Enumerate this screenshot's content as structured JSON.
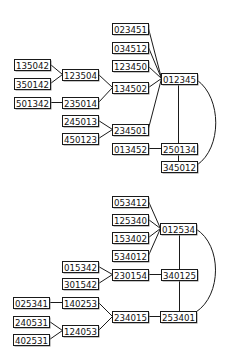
{
  "diagrams": [
    {
      "name": "graph-top",
      "nodes": [
        {
          "id": "023451",
          "label": "023451",
          "x": 112,
          "y": 23,
          "w": 36,
          "h": 11
        },
        {
          "id": "034512",
          "label": "034512",
          "x": 112,
          "y": 42,
          "w": 36,
          "h": 11
        },
        {
          "id": "123450",
          "label": "123450",
          "x": 112,
          "y": 60,
          "w": 36,
          "h": 11
        },
        {
          "id": "012345",
          "label": "012345",
          "x": 161,
          "y": 73,
          "w": 36,
          "h": 11
        },
        {
          "id": "135042",
          "label": "135042",
          "x": 14,
          "y": 59,
          "w": 36,
          "h": 11
        },
        {
          "id": "350142",
          "label": "350142",
          "x": 14,
          "y": 78,
          "w": 36,
          "h": 11
        },
        {
          "id": "123504",
          "label": "123504",
          "x": 62,
          "y": 69,
          "w": 36,
          "h": 11
        },
        {
          "id": "134502",
          "label": "134502",
          "x": 112,
          "y": 82,
          "w": 36,
          "h": 11
        },
        {
          "id": "501342",
          "label": "501342",
          "x": 14,
          "y": 97,
          "w": 36,
          "h": 11
        },
        {
          "id": "235014",
          "label": "235014",
          "x": 62,
          "y": 97,
          "w": 36,
          "h": 11
        },
        {
          "id": "245013",
          "label": "245013",
          "x": 62,
          "y": 115,
          "w": 36,
          "h": 11
        },
        {
          "id": "450123",
          "label": "450123",
          "x": 62,
          "y": 133,
          "w": 36,
          "h": 11
        },
        {
          "id": "234501",
          "label": "234501",
          "x": 112,
          "y": 124,
          "w": 36,
          "h": 11
        },
        {
          "id": "013452",
          "label": "013452",
          "x": 112,
          "y": 143,
          "w": 36,
          "h": 11
        },
        {
          "id": "250134",
          "label": "250134",
          "x": 161,
          "y": 143,
          "w": 36,
          "h": 11
        },
        {
          "id": "345012",
          "label": "345012",
          "x": 161,
          "y": 161,
          "w": 36,
          "h": 11
        }
      ],
      "edges": [
        {
          "from": "023451",
          "to": "012345",
          "type": "line",
          "pts": [
            148,
            28,
            161,
            78
          ]
        },
        {
          "from": "034512",
          "to": "012345",
          "type": "line",
          "pts": [
            148,
            47,
            161,
            78
          ]
        },
        {
          "from": "123450",
          "to": "012345",
          "type": "line",
          "pts": [
            148,
            66,
            161,
            78
          ]
        },
        {
          "from": "134502",
          "to": "012345",
          "type": "line",
          "pts": [
            148,
            87,
            161,
            78
          ]
        },
        {
          "from": "234501",
          "to": "012345",
          "type": "line",
          "pts": [
            148,
            128,
            161,
            78
          ]
        },
        {
          "from": "135042",
          "to": "123504",
          "type": "line",
          "pts": [
            50,
            64,
            62,
            74
          ]
        },
        {
          "from": "350142",
          "to": "123504",
          "type": "line",
          "pts": [
            50,
            83,
            62,
            74
          ]
        },
        {
          "from": "123504",
          "to": "134502",
          "type": "line",
          "pts": [
            98,
            74,
            112,
            87
          ]
        },
        {
          "from": "501342",
          "to": "235014",
          "type": "line",
          "pts": [
            50,
            102,
            62,
            102
          ]
        },
        {
          "from": "235014",
          "to": "134502",
          "type": "line",
          "pts": [
            98,
            102,
            112,
            87
          ]
        },
        {
          "from": "245013",
          "to": "234501",
          "type": "line",
          "pts": [
            98,
            120,
            112,
            129
          ]
        },
        {
          "from": "450123",
          "to": "234501",
          "type": "line",
          "pts": [
            98,
            138,
            112,
            129
          ]
        },
        {
          "from": "013452",
          "to": "250134",
          "type": "line",
          "pts": [
            148,
            148,
            161,
            148
          ]
        },
        {
          "from": "012345",
          "to": "250134",
          "type": "line",
          "pts": [
            178,
            84,
            178,
            143
          ]
        },
        {
          "from": "250134",
          "to": "345012",
          "type": "line",
          "pts": [
            178,
            154,
            178,
            161
          ]
        },
        {
          "from": "012345",
          "to": "345012",
          "type": "curve",
          "d": "M 197 80 C 222 98, 222 148, 197 165"
        }
      ]
    },
    {
      "name": "graph-bottom",
      "nodes": [
        {
          "id": "053412",
          "label": "053412",
          "x": 112,
          "y": 196,
          "w": 36,
          "h": 11
        },
        {
          "id": "125340",
          "label": "125340",
          "x": 112,
          "y": 214,
          "w": 36,
          "h": 11
        },
        {
          "id": "153402",
          "label": "153402",
          "x": 112,
          "y": 232,
          "w": 36,
          "h": 11
        },
        {
          "id": "534012",
          "label": "534012",
          "x": 112,
          "y": 250,
          "w": 36,
          "h": 11
        },
        {
          "id": "012534",
          "label": "012534",
          "x": 160,
          "y": 223,
          "w": 36,
          "h": 11
        },
        {
          "id": "015342",
          "label": "015342",
          "x": 62,
          "y": 261,
          "w": 36,
          "h": 11
        },
        {
          "id": "301542",
          "label": "301542",
          "x": 62,
          "y": 278,
          "w": 36,
          "h": 11
        },
        {
          "id": "230154",
          "label": "230154",
          "x": 112,
          "y": 269,
          "w": 36,
          "h": 11
        },
        {
          "id": "340125",
          "label": "340125",
          "x": 161,
          "y": 269,
          "w": 36,
          "h": 11
        },
        {
          "id": "025341",
          "label": "025341",
          "x": 13,
          "y": 297,
          "w": 36,
          "h": 11
        },
        {
          "id": "140253",
          "label": "140253",
          "x": 62,
          "y": 297,
          "w": 36,
          "h": 11
        },
        {
          "id": "240531",
          "label": "240531",
          "x": 13,
          "y": 316,
          "w": 36,
          "h": 11
        },
        {
          "id": "124053",
          "label": "124053",
          "x": 62,
          "y": 325,
          "w": 36,
          "h": 11
        },
        {
          "id": "402531",
          "label": "402531",
          "x": 13,
          "y": 334,
          "w": 36,
          "h": 11
        },
        {
          "id": "234015",
          "label": "234015",
          "x": 112,
          "y": 311,
          "w": 36,
          "h": 11
        },
        {
          "id": "253401",
          "label": "253401",
          "x": 160,
          "y": 311,
          "w": 36,
          "h": 11
        }
      ],
      "edges": [
        {
          "from": "053412",
          "to": "012534",
          "type": "line",
          "pts": [
            148,
            201,
            160,
            228
          ]
        },
        {
          "from": "125340",
          "to": "012534",
          "type": "line",
          "pts": [
            148,
            219,
            160,
            228
          ]
        },
        {
          "from": "153402",
          "to": "012534",
          "type": "line",
          "pts": [
            148,
            237,
            160,
            228
          ]
        },
        {
          "from": "534012",
          "to": "012534",
          "type": "line",
          "pts": [
            148,
            255,
            160,
            228
          ]
        },
        {
          "from": "015342",
          "to": "230154",
          "type": "line",
          "pts": [
            98,
            266,
            112,
            274
          ]
        },
        {
          "from": "301542",
          "to": "230154",
          "type": "line",
          "pts": [
            98,
            283,
            112,
            274
          ]
        },
        {
          "from": "230154",
          "to": "340125",
          "type": "line",
          "pts": [
            148,
            274,
            161,
            274
          ]
        },
        {
          "from": "012534",
          "to": "340125",
          "type": "line",
          "pts": [
            179,
            234,
            179,
            269
          ]
        },
        {
          "from": "340125",
          "to": "253401",
          "type": "line",
          "pts": [
            179,
            280,
            179,
            311
          ]
        },
        {
          "from": "025341",
          "to": "140253",
          "type": "line",
          "pts": [
            49,
            302,
            62,
            302
          ]
        },
        {
          "from": "140253",
          "to": "234015",
          "type": "line",
          "pts": [
            98,
            302,
            112,
            316
          ]
        },
        {
          "from": "240531",
          "to": "124053",
          "type": "line",
          "pts": [
            49,
            321,
            62,
            330
          ]
        },
        {
          "from": "402531",
          "to": "124053",
          "type": "line",
          "pts": [
            49,
            339,
            62,
            330
          ]
        },
        {
          "from": "124053",
          "to": "234015",
          "type": "line",
          "pts": [
            98,
            330,
            112,
            316
          ]
        },
        {
          "from": "234015",
          "to": "253401",
          "type": "line",
          "pts": [
            148,
            316,
            160,
            316
          ]
        },
        {
          "from": "012534",
          "to": "253401",
          "type": "curve",
          "d": "M 196 229 C 222 245, 222 295, 196 312"
        }
      ]
    }
  ],
  "colors": {
    "edge": "#1a1a1a",
    "node_border": "#1a1a1a",
    "node_fill": "#ffffff",
    "node_shadow": "#8a8a8a",
    "text": "#111111"
  }
}
